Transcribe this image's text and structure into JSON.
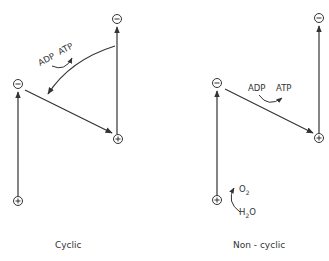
{
  "diagrams": {
    "cyclic": {
      "caption": "Cyclic",
      "adp_label": "ADP",
      "atp_label": "ATP"
    },
    "noncyclic": {
      "caption": "Non - cyclic",
      "adp_label": "ADP",
      "atp_label": "ATP",
      "o2_label": "O",
      "o2_sub": "2",
      "h2o_h": "H",
      "h2o_sub": "2",
      "h2o_o": "O"
    }
  },
  "symbols": {
    "minus": "−",
    "plus": "+"
  },
  "colors": {
    "line": "#333333",
    "background": "#ffffff"
  }
}
